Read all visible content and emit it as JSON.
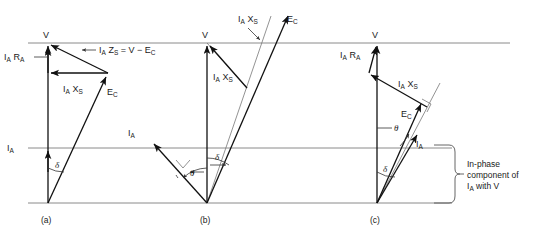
{
  "figure": {
    "panels": [
      {
        "id": "a",
        "label": "(a)",
        "labels": {
          "terminal_voltage": "V",
          "resistance_drop": "I",
          "resistance_drop_sub1": "A",
          "resistance_drop_r": "R",
          "resistance_drop_sub2": "A",
          "reactance_drop": "I",
          "reactance_drop_sub1": "A",
          "reactance_drop_x": "X",
          "reactance_drop_sub2": "S",
          "impedance_eq": "Z",
          "impedance_eq_sub": "S",
          "impedance_eq_rest": "= V − E",
          "impedance_eq_rest_sub": "C",
          "emf": "E",
          "emf_sub": "C",
          "current": "I",
          "current_sub": "A",
          "delta": "δ"
        }
      },
      {
        "id": "b",
        "label": "(b)",
        "labels": {
          "terminal_voltage": "V",
          "reactance_drop": "I",
          "reactance_drop_sub1": "A",
          "reactance_drop_x": "X",
          "reactance_drop_sub2": "S",
          "emf": "E",
          "emf_sub": "C",
          "current": "I",
          "current_sub": "A",
          "delta": "δ",
          "theta": "θ"
        }
      },
      {
        "id": "c",
        "label": "(c)",
        "labels": {
          "terminal_voltage": "V",
          "resistance_drop": "I",
          "resistance_drop_sub1": "A",
          "resistance_drop_r": "R",
          "resistance_drop_sub2": "A",
          "reactance_drop": "I",
          "reactance_drop_sub1": "A",
          "reactance_drop_x": "X",
          "reactance_drop_sub2": "S",
          "emf": "E",
          "emf_sub": "C",
          "current": "I",
          "current_sub": "A",
          "delta": "δ",
          "theta": "θ"
        }
      }
    ],
    "annotation": {
      "line1": "In-phase",
      "line2": "component of",
      "line3_a": "I",
      "line3_sub": "A",
      "line3_b": " with V"
    },
    "colors": {
      "vector": "#111111",
      "axis": "#8a8a8a",
      "thin": "#777777",
      "text": "#1a1a1a",
      "background": "#ffffff"
    }
  }
}
